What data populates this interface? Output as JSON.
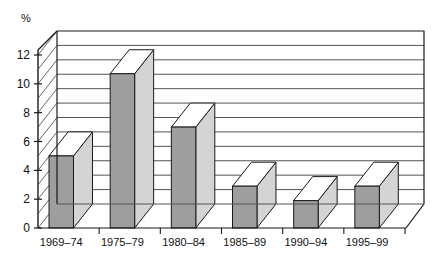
{
  "chart_data": {
    "type": "bar",
    "title": "",
    "subtitle": "",
    "xlabel": "",
    "ylabel": "%",
    "categories": [
      "1969–74",
      "1975–79",
      "1980–84",
      "1985–89",
      "1990–94",
      "1995–99"
    ],
    "values": [
      5.0,
      10.7,
      7.0,
      2.9,
      1.9,
      2.9
    ],
    "ylim": [
      0,
      12
    ],
    "y_ticks": [
      "0",
      "2",
      "4",
      "6",
      "8",
      "10",
      "12"
    ],
    "y_tick_values": [
      0,
      2,
      4,
      6,
      8,
      10,
      12
    ],
    "gridline_step": 1,
    "grid": true,
    "legend": "none",
    "style": "3d-column",
    "series": [
      {
        "name": "percent",
        "values": [
          5.0,
          10.7,
          7.0,
          2.9,
          1.9,
          2.9
        ]
      }
    ]
  },
  "colors": {
    "bar_front": "#9e9e9e",
    "bar_top": "#ffffff",
    "bar_side": "#d4d4d4",
    "bar_outline": "#1a1a1a",
    "grid": "#555555",
    "axis": "#1a1a1a",
    "plot_background": "#ffffff",
    "page_background": "#ffffff",
    "text": "#111111"
  },
  "axis": {
    "y_unit_label": "%",
    "tick_marks": true
  }
}
